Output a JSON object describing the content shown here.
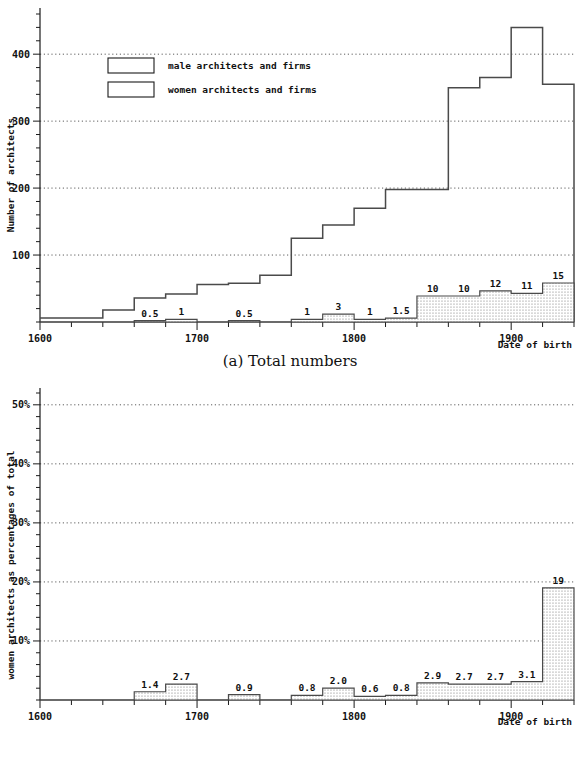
{
  "figure": {
    "panels": [
      {
        "id": "a",
        "caption": "(a) Total numbers",
        "ylabel": "Number of architects",
        "xlabel": "Date of birth",
        "ytick_labels": [
          "100",
          "200",
          "300",
          "400"
        ],
        "xtick_labels": [
          "1600",
          "1700",
          "1800",
          "1900"
        ],
        "legend": [
          {
            "key": "male",
            "label": "male architects and firms",
            "swatch": "empty"
          },
          {
            "key": "women",
            "label": "women architects and firms",
            "swatch": "dotted"
          }
        ]
      },
      {
        "id": "b",
        "caption": "(b) Percentages",
        "ylabel": "women architects as percentages of total",
        "xlabel": "Date of birth",
        "ytick_labels": [
          "10%",
          "20%",
          "30%",
          "40%",
          "50%"
        ],
        "xtick_labels": [
          "1600",
          "1700",
          "1800",
          "1900"
        ]
      }
    ]
  },
  "colors": {
    "ink": "#111111",
    "line": "#4a4a4a",
    "grid": "#333333",
    "fill_women": "#d8d8d8",
    "background": "#ffffff"
  },
  "chart_data": [
    {
      "type": "bar",
      "panel": "a",
      "title": "(a) Total numbers",
      "xlabel": "Date of birth",
      "ylabel": "Number of architects",
      "xlim": [
        1600,
        1940
      ],
      "ylim": [
        0,
        460
      ],
      "bin_width": 20,
      "grid": true,
      "gridlines_y": [
        100,
        200,
        300,
        400
      ],
      "legend_position": "upper-left",
      "categories": [
        "1600-1620",
        "1620-1640",
        "1640-1660",
        "1660-1680",
        "1680-1700",
        "1700-1720",
        "1720-1740",
        "1740-1760",
        "1760-1780",
        "1780-1800",
        "1800-1820",
        "1820-1840",
        "1840-1860",
        "1860-1880",
        "1880-1900",
        "1900-1920",
        "1920-1940"
      ],
      "bin_starts": [
        1600,
        1620,
        1640,
        1660,
        1680,
        1700,
        1720,
        1740,
        1760,
        1780,
        1800,
        1820,
        1840,
        1860,
        1880,
        1900,
        1920
      ],
      "series": [
        {
          "name": "male architects and firms",
          "values": [
            6,
            6,
            18,
            36,
            42,
            56,
            58,
            70,
            125,
            145,
            170,
            198,
            198,
            350,
            365,
            440,
            355
          ]
        },
        {
          "name": "women architects and firms",
          "values": [
            0,
            0,
            0,
            0.5,
            1,
            0,
            0.5,
            0,
            1,
            3,
            1,
            1.5,
            10,
            10,
            12,
            11,
            15
          ]
        }
      ],
      "women_labels": [
        "",
        "",
        "",
        "0.5",
        "1",
        "",
        "0.5",
        "",
        "1",
        "3",
        "1",
        "1.5",
        "10",
        "10",
        "12",
        "11",
        "15"
      ]
    },
    {
      "type": "bar",
      "panel": "b",
      "title": "(b) Percentages",
      "xlabel": "Date of birth",
      "ylabel": "women architects as percentages of total",
      "xlim": [
        1600,
        1940
      ],
      "ylim": [
        0,
        52
      ],
      "bin_width": 20,
      "grid": true,
      "gridlines_y": [
        10,
        20,
        30,
        40,
        50
      ],
      "categories": [
        "1600-1620",
        "1620-1640",
        "1640-1660",
        "1660-1680",
        "1680-1700",
        "1700-1720",
        "1720-1740",
        "1740-1760",
        "1760-1780",
        "1780-1800",
        "1800-1820",
        "1820-1840",
        "1840-1860",
        "1860-1880",
        "1880-1900",
        "1900-1920",
        "1920-1940"
      ],
      "bin_starts": [
        1600,
        1620,
        1640,
        1660,
        1680,
        1700,
        1720,
        1740,
        1760,
        1780,
        1800,
        1820,
        1840,
        1860,
        1880,
        1900,
        1920
      ],
      "values": [
        0,
        0,
        0,
        1.4,
        2.7,
        0,
        0.9,
        0,
        0.8,
        2.0,
        0.6,
        0.8,
        2.9,
        2.7,
        2.7,
        3.1,
        19
      ],
      "value_labels": [
        "",
        "",
        "",
        "1.4",
        "2.7",
        "",
        "0.9",
        "",
        "0.8",
        "2.0",
        "0.6",
        "0.8",
        "2.9",
        "2.7",
        "2.7",
        "3.1",
        "19"
      ]
    }
  ]
}
